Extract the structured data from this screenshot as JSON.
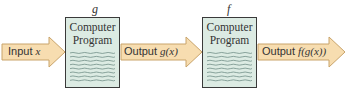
{
  "diagram": {
    "input": {
      "label": "Input",
      "var": "x"
    },
    "stage1": {
      "function_name": "g",
      "box_line1": "Computer",
      "box_line2": "Program"
    },
    "middle": {
      "label": "Output",
      "expr": "g(x)"
    },
    "stage2": {
      "function_name": "f",
      "box_line1": "Computer",
      "box_line2": "Program"
    },
    "output": {
      "label": "Output",
      "expr": "f(g(x))"
    }
  },
  "colors": {
    "arrow_fill": "#f7ddb0",
    "arrow_stroke": "#c9a46b",
    "box_fill": "#dcebe3",
    "box_stroke": "#3a3a3a",
    "wave_line": "#5f7f78"
  }
}
